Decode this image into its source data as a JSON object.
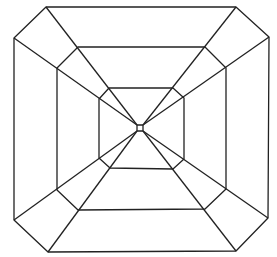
{
  "diagram": {
    "type": "line-drawing",
    "stroke_color": "#222222",
    "background": "#ffffff",
    "center": [
      140,
      128
    ],
    "rings": {
      "outer": [
        [
          46,
          7
        ],
        [
          236,
          7
        ],
        [
          269,
          37
        ],
        [
          268,
          218
        ],
        [
          236,
          251
        ],
        [
          48,
          252
        ],
        [
          14,
          220
        ],
        [
          14,
          38
        ]
      ],
      "middle": [
        [
          78,
          47
        ],
        [
          205,
          47
        ],
        [
          226,
          68
        ],
        [
          226,
          189
        ],
        [
          205,
          209
        ],
        [
          78,
          210
        ],
        [
          57,
          190
        ],
        [
          57,
          68
        ]
      ],
      "inner": [
        [
          109,
          88
        ],
        [
          173,
          88
        ],
        [
          184,
          98
        ],
        [
          184,
          159
        ],
        [
          173,
          169
        ],
        [
          110,
          168
        ],
        [
          99,
          158
        ],
        [
          99,
          99
        ]
      ],
      "culet": [
        [
          137,
          125
        ],
        [
          143,
          125
        ],
        [
          143,
          131
        ],
        [
          137,
          131
        ]
      ]
    },
    "corner_rays": [
      [
        [
          46,
          7
        ],
        [
          137,
          125
        ]
      ],
      [
        [
          14,
          38
        ],
        [
          137,
          125
        ]
      ],
      [
        [
          236,
          7
        ],
        [
          143,
          125
        ]
      ],
      [
        [
          269,
          37
        ],
        [
          143,
          125
        ]
      ],
      [
        [
          268,
          218
        ],
        [
          143,
          131
        ]
      ],
      [
        [
          236,
          251
        ],
        [
          143,
          131
        ]
      ],
      [
        [
          48,
          252
        ],
        [
          137,
          131
        ]
      ],
      [
        [
          14,
          220
        ],
        [
          137,
          131
        ]
      ]
    ]
  }
}
